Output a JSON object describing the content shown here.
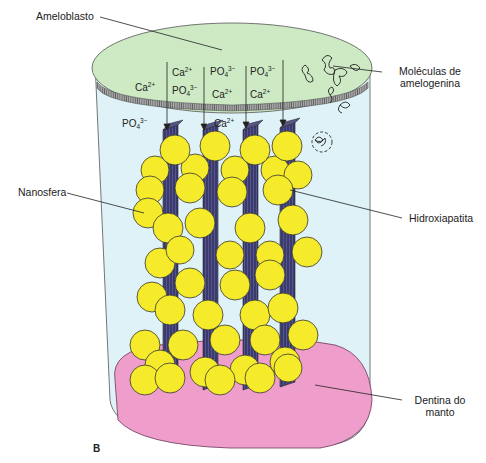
{
  "labels": {
    "ameloblasto": "Ameloblasto",
    "moleculas_line1": "Moléculas de",
    "moleculas_line2": "amelogenina",
    "nanosfera": "Nanosfera",
    "hidroxiapatita": "Hidroxiapatita",
    "dentina_line1": "Dentina do",
    "dentina_line2": "manto",
    "panel": "B"
  },
  "ions": [
    {
      "base": "Ca",
      "sub": "",
      "sup": "2+",
      "x": 135,
      "y": 79
    },
    {
      "base": "Ca",
      "sub": "",
      "sup": "2+",
      "x": 172,
      "y": 64
    },
    {
      "base": "PO",
      "sub": "4",
      "sup": "3−",
      "x": 172,
      "y": 82
    },
    {
      "base": "PO",
      "sub": "4",
      "sup": "3−",
      "x": 210,
      "y": 63
    },
    {
      "base": "Ca",
      "sub": "",
      "sup": "2+",
      "x": 212,
      "y": 86
    },
    {
      "base": "PO",
      "sub": "4",
      "sup": "3−",
      "x": 250,
      "y": 63
    },
    {
      "base": "Ca",
      "sub": "",
      "sup": "2+",
      "x": 250,
      "y": 86
    },
    {
      "base": "PO",
      "sub": "4",
      "sup": "3−",
      "x": 122,
      "y": 115
    },
    {
      "base": "Ca",
      "sub": "",
      "sup": "2+",
      "x": 214,
      "y": 115
    }
  ],
  "colors": {
    "ameloblast_fill": "#cdeac4",
    "matrix_fill": "#dff2f7",
    "dentin_fill": "#ef9ecb",
    "nanosphere_fill": "#f5eb2a",
    "crystal_fill": "#3a3a6e",
    "outline": "#333333"
  }
}
